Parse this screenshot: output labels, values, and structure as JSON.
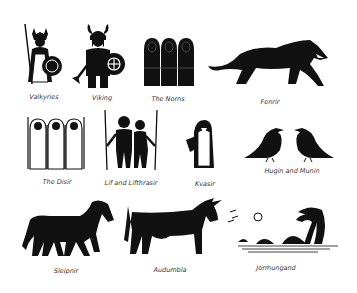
{
  "colors": {
    "ink": "#111111",
    "label": "#333333",
    "background": "#ffffff"
  },
  "items": [
    {
      "id": "valkyries",
      "label": "Valkyries",
      "icon": "valkyrie-icon"
    },
    {
      "id": "viking",
      "label": "Viking",
      "icon": "viking-icon"
    },
    {
      "id": "norns",
      "label": "The Norns",
      "icon": "norns-icon"
    },
    {
      "id": "fenrir",
      "label": "Fenrir",
      "icon": "wolf-icon"
    },
    {
      "id": "disir",
      "label": "The Disir",
      "icon": "disir-icon"
    },
    {
      "id": "lif",
      "label": "Lif and Lifthrasir",
      "icon": "couple-icon"
    },
    {
      "id": "kvasir",
      "label": "Kvasir",
      "icon": "kvasir-icon"
    },
    {
      "id": "hugin",
      "label": "Hugin and Munin",
      "icon": "ravens-icon"
    },
    {
      "id": "sleipnir",
      "label": "Sleipnir",
      "icon": "horse-icon"
    },
    {
      "id": "audumbla",
      "label": "Audumbla",
      "icon": "cow-icon"
    },
    {
      "id": "jormungand",
      "label": "Jormungand",
      "icon": "sea-serpent-icon"
    }
  ]
}
